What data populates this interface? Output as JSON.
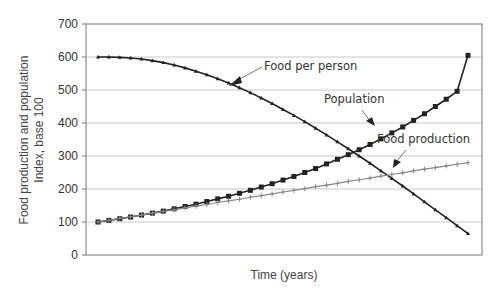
{
  "chart_data": {
    "type": "line",
    "title": "",
    "xlabel": "Time (years)",
    "ylabel_line1": "Food production and population",
    "ylabel_line2": "Index, base 100",
    "ylim": [
      0,
      700
    ],
    "yticks": [
      "0",
      "100",
      "200",
      "300",
      "400",
      "500",
      "600",
      "700"
    ],
    "grid": true,
    "legend": "none (inline annotations with arrows)",
    "x": [
      0,
      1,
      2,
      3,
      4,
      5,
      6,
      7,
      8,
      9,
      10,
      11,
      12,
      13,
      14,
      15,
      16,
      17,
      18,
      19,
      20,
      21,
      22,
      23,
      24,
      25,
      26,
      27,
      28,
      29,
      30,
      31,
      32,
      33,
      34
    ],
    "series": [
      {
        "name": "Food per person",
        "marker": "triangle",
        "color": "#222222",
        "values": [
          600,
          600,
          599,
          597,
          594,
          589,
          583,
          576,
          567,
          557,
          546,
          534,
          521,
          507,
          492,
          476,
          459,
          441,
          423,
          404,
          384,
          364,
          343,
          322,
          300,
          278,
          255,
          232,
          209,
          185,
          161,
          137,
          113,
          89,
          65
        ]
      },
      {
        "name": "Population",
        "marker": "square",
        "color": "#222222",
        "values": [
          100,
          105,
          110,
          115,
          121,
          127,
          133,
          140,
          147,
          154,
          162,
          170,
          178,
          187,
          196,
          206,
          216,
          227,
          238,
          250,
          262,
          276,
          290,
          304,
          319,
          335,
          352,
          370,
          388,
          408,
          428,
          450,
          472,
          496,
          605
        ]
      },
      {
        "name": "Food production",
        "marker": "plus",
        "color": "#888888",
        "values": [
          100,
          105,
          111,
          116,
          121,
          127,
          132,
          137,
          143,
          148,
          153,
          159,
          164,
          169,
          175,
          180,
          185,
          191,
          196,
          201,
          207,
          212,
          217,
          223,
          228,
          233,
          239,
          244,
          249,
          255,
          260,
          265,
          270,
          275,
          280
        ]
      }
    ],
    "annotations": [
      {
        "text": "Food per person",
        "points_to": "Food per person"
      },
      {
        "text": "Population",
        "points_to": "Population"
      },
      {
        "text": "Food production",
        "points_to": "Food production"
      }
    ]
  }
}
